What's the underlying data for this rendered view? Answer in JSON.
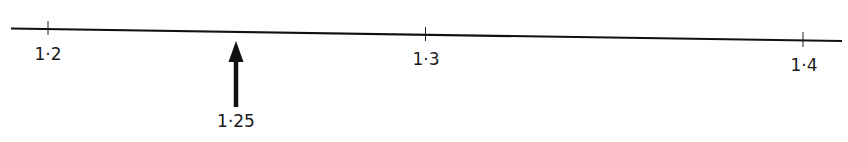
{
  "diagram": {
    "type": "number-line",
    "ticks": [
      {
        "value": 1.2,
        "label": "1·2"
      },
      {
        "value": 1.3,
        "label": "1·3"
      },
      {
        "value": 1.4,
        "label": "1·4"
      }
    ],
    "marker": {
      "value": 1.25,
      "label": "1·25",
      "direction": "up"
    },
    "colors": {
      "line": "#111111",
      "text": "#1a1a1a"
    }
  }
}
